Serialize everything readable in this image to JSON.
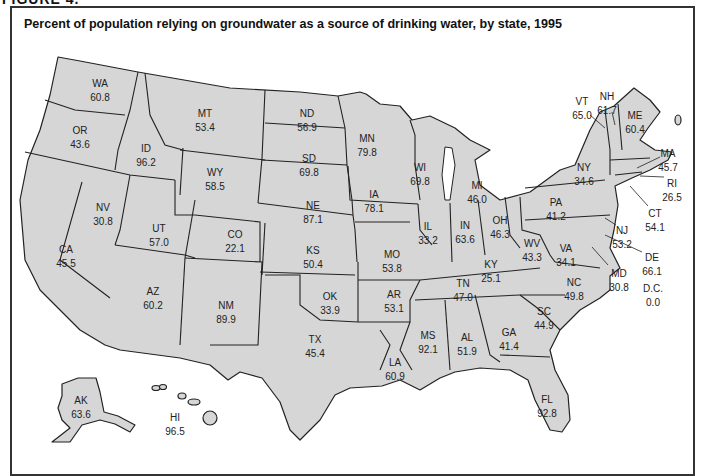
{
  "figure": {
    "label": "FIGURE 4."
  },
  "title": "Percent of population relying on groundwater as a source of drinking water, by state, 1995",
  "colors": {
    "state_fill": "#d6d6d6",
    "border": "#222222",
    "background": "#ffffff"
  },
  "states": [
    {
      "abbr": "WA",
      "value": "60.8",
      "x": 100,
      "y": 83
    },
    {
      "abbr": "OR",
      "value": "43.6",
      "x": 80,
      "y": 130
    },
    {
      "abbr": "ID",
      "value": "96.2",
      "x": 146,
      "y": 148
    },
    {
      "abbr": "MT",
      "value": "53.4",
      "x": 205,
      "y": 113
    },
    {
      "abbr": "WY",
      "value": "58.5",
      "x": 215,
      "y": 172
    },
    {
      "abbr": "ND",
      "value": "56.9",
      "x": 307,
      "y": 113
    },
    {
      "abbr": "SD",
      "value": "69.8",
      "x": 309,
      "y": 158
    },
    {
      "abbr": "NE",
      "value": "87.1",
      "x": 313,
      "y": 205
    },
    {
      "abbr": "MN",
      "value": "79.8",
      "x": 367,
      "y": 138
    },
    {
      "abbr": "WI",
      "value": "69.8",
      "x": 420,
      "y": 167
    },
    {
      "abbr": "IA",
      "value": "78.1",
      "x": 374,
      "y": 194
    },
    {
      "abbr": "MI",
      "value": "46.0",
      "x": 477,
      "y": 185
    },
    {
      "abbr": "IL",
      "value": "33.2",
      "x": 428,
      "y": 226
    },
    {
      "abbr": "IN",
      "value": "63.6",
      "x": 465,
      "y": 225
    },
    {
      "abbr": "OH",
      "value": "46.3",
      "x": 500,
      "y": 220
    },
    {
      "abbr": "PA",
      "value": "41.2",
      "x": 556,
      "y": 202
    },
    {
      "abbr": "NY",
      "value": "34.6",
      "x": 584,
      "y": 167
    },
    {
      "abbr": "VT",
      "value": "65.0",
      "x": 582,
      "y": 101
    },
    {
      "abbr": "NH",
      "value": "61.7",
      "x": 607,
      "y": 96
    },
    {
      "abbr": "ME",
      "value": "60.4",
      "x": 635,
      "y": 115
    },
    {
      "abbr": "MA",
      "value": "45.7",
      "x": 668,
      "y": 153
    },
    {
      "abbr": "RI",
      "value": "26.5",
      "x": 672,
      "y": 183
    },
    {
      "abbr": "CT",
      "value": "54.1",
      "x": 655,
      "y": 213
    },
    {
      "abbr": "NJ",
      "value": "53.2",
      "x": 622,
      "y": 230
    },
    {
      "abbr": "DE",
      "value": "66.1",
      "x": 652,
      "y": 257
    },
    {
      "abbr": "MD",
      "value": "30.8",
      "x": 619,
      "y": 273
    },
    {
      "abbr": "D.C.",
      "value": "0.0",
      "x": 653,
      "y": 288
    },
    {
      "abbr": "WV",
      "value": "43.3",
      "x": 532,
      "y": 243
    },
    {
      "abbr": "VA",
      "value": "34.1",
      "x": 566,
      "y": 248
    },
    {
      "abbr": "KY",
      "value": "25.1",
      "x": 491,
      "y": 264
    },
    {
      "abbr": "TN",
      "value": "47.0",
      "x": 463,
      "y": 283
    },
    {
      "abbr": "NC",
      "value": "49.8",
      "x": 574,
      "y": 282
    },
    {
      "abbr": "SC",
      "value": "44.9",
      "x": 544,
      "y": 311
    },
    {
      "abbr": "GA",
      "value": "41.4",
      "x": 509,
      "y": 332
    },
    {
      "abbr": "AL",
      "value": "51.9",
      "x": 467,
      "y": 337
    },
    {
      "abbr": "MS",
      "value": "92.1",
      "x": 428,
      "y": 335
    },
    {
      "abbr": "FL",
      "value": "92.8",
      "x": 547,
      "y": 399
    },
    {
      "abbr": "LA",
      "value": "60.9",
      "x": 395,
      "y": 362
    },
    {
      "abbr": "AR",
      "value": "53.1",
      "x": 394,
      "y": 294
    },
    {
      "abbr": "MO",
      "value": "53.8",
      "x": 392,
      "y": 254
    },
    {
      "abbr": "KS",
      "value": "50.4",
      "x": 313,
      "y": 250
    },
    {
      "abbr": "OK",
      "value": "33.9",
      "x": 330,
      "y": 296
    },
    {
      "abbr": "TX",
      "value": "45.4",
      "x": 315,
      "y": 339
    },
    {
      "abbr": "NM",
      "value": "89.9",
      "x": 226,
      "y": 305
    },
    {
      "abbr": "CO",
      "value": "22.1",
      "x": 235,
      "y": 234
    },
    {
      "abbr": "UT",
      "value": "57.0",
      "x": 159,
      "y": 228
    },
    {
      "abbr": "AZ",
      "value": "60.2",
      "x": 153,
      "y": 291
    },
    {
      "abbr": "NV",
      "value": "30.8",
      "x": 103,
      "y": 207
    },
    {
      "abbr": "CA",
      "value": "45.5",
      "x": 66,
      "y": 249
    },
    {
      "abbr": "AK",
      "value": "63.6",
      "x": 81,
      "y": 400
    },
    {
      "abbr": "HI",
      "value": "96.5",
      "x": 175,
      "y": 417
    }
  ]
}
